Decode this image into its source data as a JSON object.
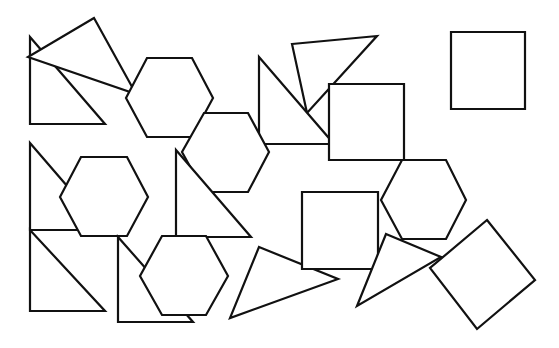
{
  "canvas": {
    "width": 559,
    "height": 348,
    "background": "#ffffff",
    "stroke": "#111111"
  },
  "shapes": [
    {
      "name": "triangle-top-left",
      "type": "triangle",
      "points": "30,37 30,124 105,124"
    },
    {
      "name": "triangle-top-left-tilted",
      "type": "triangle",
      "points": "94,18 28,57 136,94"
    },
    {
      "name": "hexagon-top-1",
      "type": "hexagon",
      "points": "147,58 192,58 213,98 192,137 147,137 126,98"
    },
    {
      "name": "triangle-top-mid-thin",
      "type": "triangle",
      "points": "292,44 377,36 307,113"
    },
    {
      "name": "triangle-top-mid",
      "type": "triangle",
      "points": "259,57 259,144 334,144"
    },
    {
      "name": "square-top-mid",
      "type": "square",
      "points": "329,84 404,84 404,160 329,160"
    },
    {
      "name": "hexagon-top-2",
      "type": "hexagon",
      "points": "204,113 248,113 269,152 248,192 204,192 182,152"
    },
    {
      "name": "square-top-right",
      "type": "square",
      "points": "451,32 525,32 525,109 451,109"
    },
    {
      "name": "triangle-mid-left",
      "type": "triangle",
      "points": "30,143 30,230 105,230"
    },
    {
      "name": "hexagon-mid-left",
      "type": "hexagon",
      "points": "81,157 127,157 148,197 127,236 81,236 60,197"
    },
    {
      "name": "triangle-mid-center",
      "type": "triangle",
      "points": "176,150 176,237 251,237"
    },
    {
      "name": "triangle-bottom-left",
      "type": "triangle",
      "points": "30,230 30,311 105,311"
    },
    {
      "name": "triangle-bottom-center",
      "type": "triangle",
      "points": "118,237 118,322 193,322"
    },
    {
      "name": "hexagon-bottom",
      "type": "hexagon",
      "points": "162,236 206,236 228,276 206,315 162,315 140,276"
    },
    {
      "name": "triangle-bottom-mid",
      "type": "triangle",
      "points": "259,247 338,279 230,318"
    },
    {
      "name": "hexagon-mid-right",
      "type": "hexagon",
      "points": "402,160 446,160 466,200 446,239 402,239 381,200"
    },
    {
      "name": "square-mid-right",
      "type": "square",
      "points": "302,192 378,192 378,269 302,269"
    },
    {
      "name": "triangle-bottom-right",
      "type": "triangle",
      "points": "386,234 441,257 357,306"
    },
    {
      "name": "diamond-bottom-right",
      "type": "square",
      "points": "487,220 535,280 477,329 430,268"
    }
  ]
}
